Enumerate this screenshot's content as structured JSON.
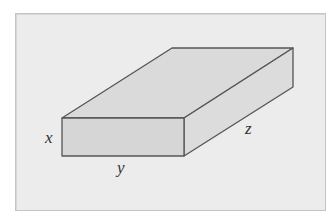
{
  "diagram": {
    "labels": {
      "x": "x",
      "y": "y",
      "z": "z"
    },
    "colors": {
      "background": "#ececec",
      "frame_border": "#c4c4c4",
      "face_fill": "#d9d9d9",
      "edge": "#555555"
    }
  }
}
